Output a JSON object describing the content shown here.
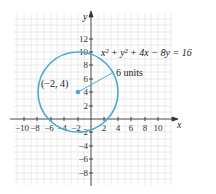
{
  "diagram": {
    "type": "circle-on-coordinate-plane",
    "equation": "x² + y² + 4x − 8y = 16",
    "center_label": "(−2, 4)",
    "radius_label": "6 units",
    "center": [
      -2,
      4
    ],
    "radius": 6,
    "x_axis_label": "x",
    "y_axis_label": "y",
    "x_ticks": [
      "−10",
      "−8",
      "−6",
      "−4",
      "−2",
      "2",
      "4",
      "6",
      "8",
      "10"
    ],
    "y_ticks": [
      "12",
      "10",
      "8",
      "6",
      "4",
      "2",
      "−2",
      "−4",
      "−6",
      "−8"
    ],
    "colors": {
      "circle": "#4aa8d8",
      "grid": "#e2e2e2",
      "axis": "#333333"
    }
  }
}
